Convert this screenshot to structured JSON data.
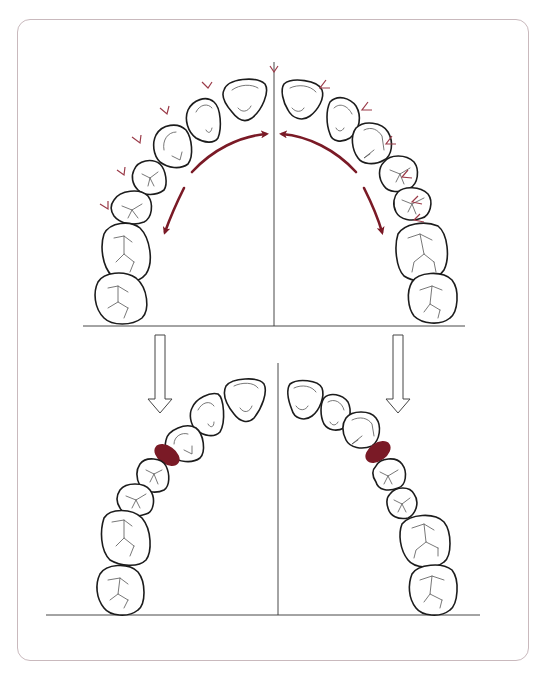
{
  "figure": {
    "colors": {
      "accent_red": "#7a1a26",
      "chevron_red": "#9a3a48",
      "tooth_outline": "#1c1c1c",
      "frame_border": "#c9b9bd",
      "background": "#ffffff"
    },
    "panels": [
      {
        "name": "upper-arch",
        "description": "Upper dental arch, 14 teeth, red curved arrows pointing toward midline from front and toward molars from canine region; small red chevrons marking contact points",
        "teeth_per_side": [
          "central-incisor",
          "lateral-incisor",
          "canine",
          "first-premolar",
          "second-premolar",
          "first-molar",
          "second-molar"
        ],
        "arrows": [
          "curved-arrow-left-to-midline",
          "curved-arrow-left-to-molar",
          "curved-arrow-right-to-midline",
          "curved-arrow-right-to-molar"
        ],
        "chevron_count": 13
      },
      {
        "name": "lower-arch",
        "description": "Resulting arch with red oval spaces between canine and first premolar on both sides",
        "teeth_per_side": [
          "central-incisor",
          "lateral-incisor",
          "canine",
          "first-premolar",
          "second-premolar",
          "first-molar",
          "second-molar"
        ],
        "space_markers": [
          "left-space-oval",
          "right-space-oval"
        ]
      }
    ],
    "transition_arrows": [
      "left-down-arrow",
      "right-down-arrow"
    ]
  }
}
